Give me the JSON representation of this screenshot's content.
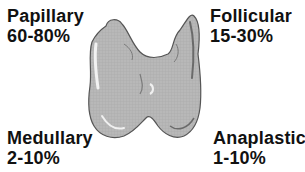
{
  "diagram": {
    "labels": [
      {
        "name": "Papillary",
        "range": "60-80%",
        "position": "top-left"
      },
      {
        "name": "Follicular",
        "range": "15-30%",
        "position": "top-right"
      },
      {
        "name": "Medullary",
        "range": "2-10%",
        "position": "bottom-left"
      },
      {
        "name": "Anaplastic",
        "range": "1-10%",
        "position": "bottom-right"
      }
    ],
    "colors": {
      "gland_fill": "#b4b4b4",
      "gland_outline": "#555555",
      "text": "#111111"
    }
  }
}
